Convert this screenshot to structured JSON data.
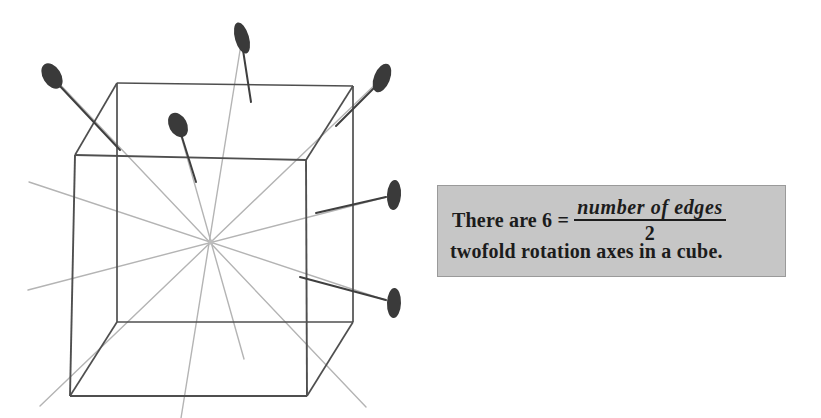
{
  "figure": {
    "title": "Twofold rotation axes in a cube",
    "shape": "cube",
    "projection": "oblique",
    "center_label": "cube-center",
    "axis_count": 6,
    "marker_count": 6,
    "marker_shape": "filled-ellipse",
    "colors": {
      "cube_edge": "#4a4a4a",
      "axis_line": "#b0b0b0",
      "marker_fill": "#3a3a3a",
      "stem": "#3f3f3f",
      "background": "#ffffff"
    },
    "cube_vertices": {
      "front_top_left": [
        75,
        155
      ],
      "front_top_right": [
        306,
        160
      ],
      "front_bottom_right": [
        307,
        396
      ],
      "front_bottom_left": [
        70,
        396
      ],
      "back_top_left": [
        117,
        83
      ],
      "back_top_right": [
        353,
        86
      ],
      "back_bottom_right": [
        353,
        322
      ],
      "back_bottom_left": [
        117,
        322
      ]
    },
    "center_point": [
      211,
      242
    ],
    "axes": [
      {
        "name": "axis-1",
        "from": [
          52,
          76
        ],
        "to": [
          366,
          407
        ]
      },
      {
        "name": "axis-2",
        "from": [
          242,
          38
        ],
        "to": [
          181,
          418
        ]
      },
      {
        "name": "axis-3",
        "from": [
          382,
          78
        ],
        "to": [
          40,
          406
        ]
      },
      {
        "name": "axis-4",
        "from": [
          178,
          125
        ],
        "to": [
          244,
          359
        ]
      },
      {
        "name": "axis-5",
        "from": [
          394,
          195
        ],
        "to": [
          28,
          290
        ]
      },
      {
        "name": "axis-6",
        "from": [
          394,
          303
        ],
        "to": [
          29,
          182
        ]
      }
    ],
    "markers": [
      {
        "name": "marker-upper-left",
        "cx": 52,
        "cy": 76,
        "rx": 9,
        "ry": 14,
        "rotate": -32
      },
      {
        "name": "marker-top",
        "cx": 242,
        "cy": 38,
        "rx": 7,
        "ry": 16,
        "rotate": -16
      },
      {
        "name": "marker-upper-right",
        "cx": 382,
        "cy": 78,
        "rx": 8,
        "ry": 15,
        "rotate": 22
      },
      {
        "name": "marker-inner-top",
        "cx": 178,
        "cy": 125,
        "rx": 9,
        "ry": 13,
        "rotate": -28
      },
      {
        "name": "marker-right-upper",
        "cx": 394,
        "cy": 195,
        "rx": 7,
        "ry": 15,
        "rotate": 4
      },
      {
        "name": "marker-right-lower",
        "cx": 394,
        "cy": 303,
        "rx": 7,
        "ry": 15,
        "rotate": 2
      }
    ],
    "stems": [
      {
        "name": "stem-upper-left",
        "x1": 58,
        "y1": 84,
        "x2": 120,
        "y2": 150
      },
      {
        "name": "stem-top",
        "x1": 243,
        "y1": 50,
        "x2": 251,
        "y2": 102
      },
      {
        "name": "stem-upper-right",
        "x1": 376,
        "y1": 86,
        "x2": 336,
        "y2": 126
      },
      {
        "name": "stem-inner-top",
        "x1": 181,
        "y1": 134,
        "x2": 196,
        "y2": 182
      },
      {
        "name": "stem-right-upper",
        "x1": 386,
        "y1": 197,
        "x2": 316,
        "y2": 213
      },
      {
        "name": "stem-right-lower",
        "x1": 386,
        "y1": 300,
        "x2": 300,
        "y2": 277
      }
    ]
  },
  "caption": {
    "lead_text": "There are 6 =",
    "fraction": {
      "numerator": "number of edges",
      "denominator": "2"
    },
    "trailing_text": "twofold rotation axes in a cube."
  }
}
